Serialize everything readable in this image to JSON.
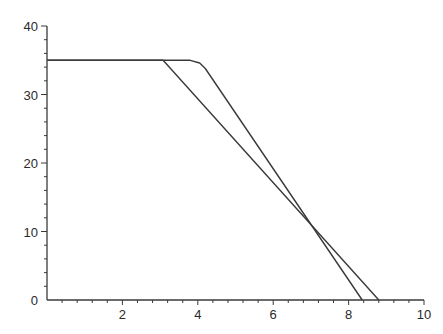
{
  "chart_data": {
    "type": "line",
    "title": "",
    "xlabel": "",
    "ylabel": "",
    "xlim": [
      0,
      10
    ],
    "ylim": [
      0,
      40
    ],
    "grid": false,
    "legend": null,
    "x_ticks": [
      {
        "value": 2,
        "label": "2"
      },
      {
        "value": 4,
        "label": "4"
      },
      {
        "value": 6,
        "label": "6"
      },
      {
        "value": 8,
        "label": "8"
      },
      {
        "value": 10,
        "label": "10"
      }
    ],
    "y_ticks": [
      {
        "value": 0,
        "label": "0"
      },
      {
        "value": 10,
        "label": "10"
      },
      {
        "value": 20,
        "label": "20"
      },
      {
        "value": 30,
        "label": "30"
      },
      {
        "value": 40,
        "label": "40"
      }
    ],
    "x_minor_step": 0.4,
    "y_minor_step": 2,
    "series": [
      {
        "name": "piecewise-linear",
        "x": [
          0,
          3.08,
          8.8
        ],
        "y": [
          35,
          35,
          0
        ],
        "color": "#3a3a3a"
      },
      {
        "name": "smooth-bend",
        "x": [
          0,
          3.8,
          4.05,
          4.2,
          8.36
        ],
        "y": [
          35,
          35,
          34.6,
          33.8,
          0
        ],
        "color": "#3a3a3a"
      }
    ]
  }
}
